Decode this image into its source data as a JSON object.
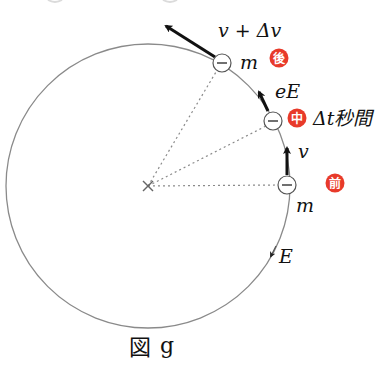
{
  "figure": {
    "caption": "図 g",
    "caption_main": "図",
    "caption_letter": "g"
  },
  "labels": {
    "velocity_after": "v + Δv",
    "force": "eE",
    "velocity_before": "v",
    "mass_after": "m",
    "mass_before": "m",
    "field": "E",
    "time_interval": "Δt秒間"
  },
  "badges": {
    "after": "後",
    "middle": "中",
    "before": "前"
  },
  "particle_symbol": "−",
  "colors": {
    "badge": "#e83a2a",
    "circle": "#8a8a8a",
    "arrow": "#111111",
    "dotted": "#8a8a8a"
  }
}
